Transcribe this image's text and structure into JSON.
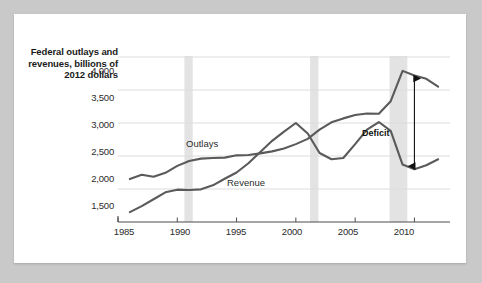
{
  "chart_data": {
    "type": "line",
    "title": "",
    "ylabel": "Federal outlays and revenues, billions of 2012 dollars",
    "xlabel": "",
    "xlim": [
      1985,
      2013
    ],
    "ylim": [
      1500,
      4000
    ],
    "ytick_labels": [
      "4,000",
      "3,500",
      "3,000",
      "2,500",
      "2,000",
      "1,500"
    ],
    "ytick_values": [
      4000,
      3500,
      3000,
      2500,
      2000,
      1500
    ],
    "xtick_labels": [
      "1985",
      "1990",
      "1995",
      "2000",
      "2005",
      "2010"
    ],
    "xtick_values": [
      1985,
      1990,
      1995,
      2000,
      2005,
      2010
    ],
    "grid": true,
    "legend": "inline-labels",
    "x": [
      1986,
      1987,
      1988,
      1989,
      1990,
      1991,
      1992,
      1993,
      1994,
      1995,
      1996,
      1997,
      1998,
      1999,
      2000,
      2001,
      2002,
      2003,
      2004,
      2005,
      2006,
      2007,
      2008,
      2009,
      2010,
      2011,
      2012
    ],
    "series": [
      {
        "name": "Outlays",
        "color": "#5a5a5a",
        "values": [
          2150,
          2215,
          2185,
          2245,
          2350,
          2425,
          2460,
          2470,
          2475,
          2510,
          2515,
          2540,
          2570,
          2615,
          2680,
          2760,
          2900,
          3010,
          3070,
          3120,
          3145,
          3140,
          3330,
          3790,
          3720,
          3670,
          3550
        ]
      },
      {
        "name": "Revenue",
        "color": "#5a5a5a",
        "values": [
          1650,
          1740,
          1845,
          1950,
          1990,
          1985,
          1995,
          2055,
          2155,
          2250,
          2390,
          2560,
          2730,
          2870,
          3000,
          2840,
          2545,
          2450,
          2470,
          2680,
          2900,
          3015,
          2880,
          2370,
          2300,
          2360,
          2450
        ]
      }
    ],
    "annotations": [
      {
        "name": "deficit",
        "label": "Deficit",
        "type": "double-arrow",
        "x": 2010,
        "y_top": 3720,
        "y_bottom": 2300
      }
    ],
    "recession_bands": [
      {
        "start": 1990.6,
        "end": 1991.3
      },
      {
        "start": 2001.2,
        "end": 2001.9
      },
      {
        "start": 2007.9,
        "end": 2009.4
      }
    ],
    "band_color": "#e3e3e3",
    "grid_color": "#dcdcdc",
    "axis_color": "#4d4d4d"
  }
}
